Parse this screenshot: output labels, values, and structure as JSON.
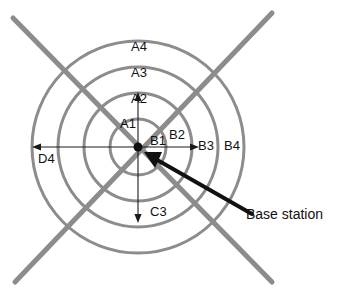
{
  "figure": {
    "kind": "concentric-ring-cell-diagram",
    "background_color": "#ffffff",
    "ring_color": "#8c8c8c",
    "diagonal_color": "#8c8c8c",
    "arrow_color": "#1a1a1a",
    "text_color": "#111111",
    "center": {
      "x": 138,
      "y": 147,
      "marker": "center-dot"
    }
  },
  "rings": [
    {
      "id": "ring-1",
      "radius": 28
    },
    {
      "id": "ring-2",
      "radius": 54
    },
    {
      "id": "ring-3",
      "radius": 80
    },
    {
      "id": "ring-4",
      "radius": 106
    }
  ],
  "labels": {
    "a4": "A4",
    "a3": "A3",
    "a2": "A2",
    "a1": "A1",
    "b1": "B1",
    "b2": "B2",
    "b3": "B3",
    "b4": "B4",
    "c3": "C3",
    "d4": "D4",
    "base_station": "Base station"
  },
  "annotations": {
    "up_arrow": "A1",
    "right_arrow": "B2",
    "down_arrow": "C3",
    "left_arrow": "D4",
    "callout": "Base station"
  }
}
